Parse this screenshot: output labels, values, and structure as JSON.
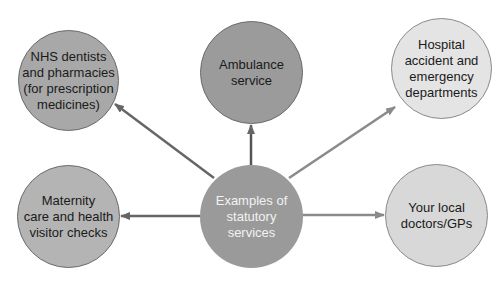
{
  "diagram": {
    "center": {
      "label": "Examples of\nstatutory\nservices",
      "color": "#9a9a9a"
    },
    "nodes": [
      {
        "id": "nhs",
        "label": "NHS dentists\nand pharmacies\n(for prescription\nmedicines)",
        "color": "#a8a8a8"
      },
      {
        "id": "ambulance",
        "label": "Ambulance\nservice",
        "color": "#9b9b9b"
      },
      {
        "id": "hospital",
        "label": "Hospital\naccident and\nemergency\ndepartments",
        "color": "#e4e4e4"
      },
      {
        "id": "maternity",
        "label": "Maternity\ncare and health\nvisitor checks",
        "color": "#b4b4b4"
      },
      {
        "id": "gp",
        "label": "Your local\ndoctors/GPs",
        "color": "#d8d8d8"
      }
    ]
  }
}
